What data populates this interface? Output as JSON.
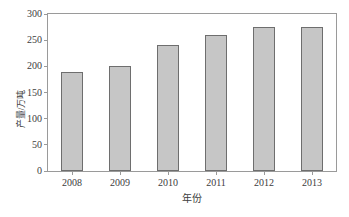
{
  "chart_data": {
    "type": "bar",
    "title": "",
    "xlabel": "年份",
    "ylabel": "产量/万吨",
    "categories": [
      "2008",
      "2009",
      "2010",
      "2011",
      "2012",
      "2013"
    ],
    "values": [
      189,
      200,
      240,
      260,
      275,
      275
    ],
    "series": [
      {
        "name": "产量",
        "values": [
          189,
          200,
          240,
          260,
          275,
          275
        ]
      }
    ],
    "ylim": [
      0,
      300
    ],
    "yticks": [
      0,
      50,
      100,
      150,
      200,
      250,
      300
    ],
    "ytick_labels": [
      "0",
      "50",
      "100",
      "150",
      "200",
      "250",
      "300"
    ],
    "grid": false,
    "legend": null,
    "legend_position": "none",
    "bar_fill_color": "#c6c6c6",
    "bar_edge_color": "#6e6e6e",
    "frame_color": "#9a9a9a",
    "text_color": "#3d3d3d",
    "background_color": "#ffffff"
  }
}
